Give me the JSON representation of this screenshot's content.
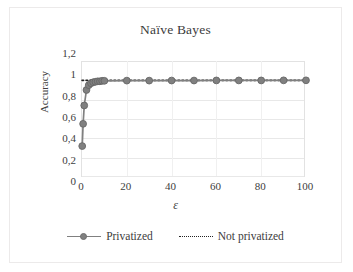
{
  "figure": {
    "title": "Naïve Bayes",
    "border_color": "#eceaea"
  },
  "axes": {
    "y_title": "Accuracy",
    "x_title": "ε",
    "y_ticks": [
      "1,2",
      "1",
      "0,8",
      "0,6",
      "0,4",
      "0,2",
      "0"
    ],
    "x_ticks": [
      "0",
      "20",
      "40",
      "60",
      "80",
      "100"
    ]
  },
  "legend": {
    "items": [
      {
        "label": "Privatized",
        "style": "solid-marker",
        "color": "#808080"
      },
      {
        "label": "Not privatized",
        "style": "dotted",
        "color": "#222222"
      }
    ]
  },
  "chart_data": {
    "type": "line",
    "title": "Naïve Bayes",
    "xlabel": "ε",
    "ylabel": "Accuracy",
    "xlim": [
      0,
      100
    ],
    "ylim": [
      0,
      1.2
    ],
    "y_tick_values": [
      0,
      0.2,
      0.4,
      0.6,
      0.8,
      1,
      1.2
    ],
    "x_tick_values": [
      0,
      20,
      40,
      60,
      80,
      100
    ],
    "grid": "horizontal",
    "legend_position": "bottom",
    "series": [
      {
        "name": "Privatized",
        "color": "#808080",
        "marker": "circle",
        "line_style": "solid",
        "x": [
          0.1,
          0.5,
          1,
          2,
          3,
          4,
          5,
          6,
          7,
          8,
          9,
          10,
          20,
          30,
          40,
          50,
          60,
          70,
          80,
          90,
          100
        ],
        "values": [
          0.32,
          0.55,
          0.74,
          0.9,
          0.95,
          0.97,
          0.98,
          0.985,
          0.99,
          0.99,
          0.995,
          0.995,
          0.997,
          0.997,
          0.998,
          0.998,
          0.999,
          0.999,
          0.999,
          1.0,
          1.0
        ]
      },
      {
        "name": "Not privatized",
        "color": "#222222",
        "marker": "none",
        "line_style": "dotted",
        "x": [
          0,
          100
        ],
        "values": [
          1.0,
          1.0
        ]
      }
    ]
  }
}
